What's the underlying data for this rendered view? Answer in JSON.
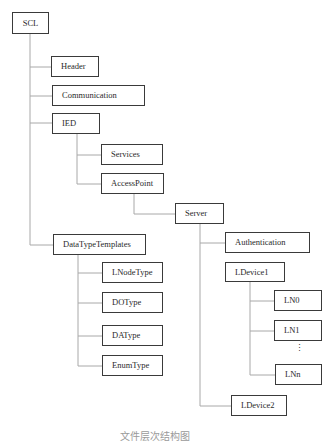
{
  "diagram": {
    "type": "tree",
    "root": "SCL",
    "nodes": {
      "scl": "SCL",
      "header": "Header",
      "communication": "Communication",
      "ied": "IED",
      "services": "Services",
      "access_point": "AccessPoint",
      "server": "Server",
      "data_type_templates": "DataTypeTemplates",
      "authentication": "Authentication",
      "ldevice1": "LDevice1",
      "lnode_type": "LNodeType",
      "do_type": "DOType",
      "da_type": "DAType",
      "enum_type": "EnumType",
      "ln0": "LN0",
      "ln1": "LN1",
      "lnn": "LNn",
      "ldevice2": "LDevice2"
    },
    "ellipsis": "⋮",
    "edges": [
      [
        "SCL",
        "Header"
      ],
      [
        "SCL",
        "Communication"
      ],
      [
        "SCL",
        "IED"
      ],
      [
        "SCL",
        "DataTypeTemplates"
      ],
      [
        "IED",
        "Services"
      ],
      [
        "IED",
        "AccessPoint"
      ],
      [
        "AccessPoint",
        "Server"
      ],
      [
        "Server",
        "Authentication"
      ],
      [
        "Server",
        "LDevice1"
      ],
      [
        "Server",
        "LDevice2"
      ],
      [
        "LDevice1",
        "LN0"
      ],
      [
        "LDevice1",
        "LN1"
      ],
      [
        "LDevice1",
        "LNn"
      ],
      [
        "DataTypeTemplates",
        "LNodeType"
      ],
      [
        "DataTypeTemplates",
        "DOType"
      ],
      [
        "DataTypeTemplates",
        "DAType"
      ],
      [
        "DataTypeTemplates",
        "EnumType"
      ]
    ],
    "caption": "文件层次结构图"
  }
}
